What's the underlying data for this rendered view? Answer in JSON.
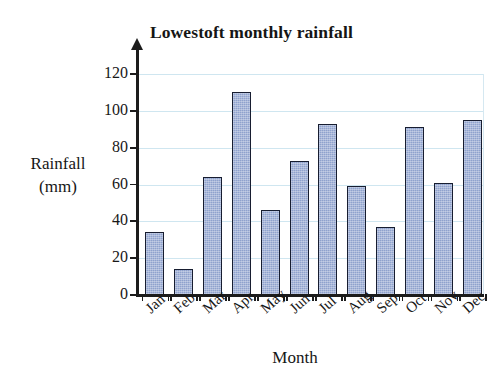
{
  "chart_data": {
    "type": "bar",
    "title": "Lowestoft monthly rainfall",
    "xlabel": "Month",
    "ylabel": "Rainfall (mm)",
    "ylabel_lines": [
      "Rainfall",
      "(mm)"
    ],
    "categories": [
      "Jan",
      "Feb",
      "Mar",
      "Apr",
      "May",
      "Jun",
      "Jul",
      "Aug",
      "Sep",
      "Oct",
      "Nov",
      "Dec"
    ],
    "values": [
      34,
      14,
      64,
      110,
      46,
      73,
      93,
      59,
      37,
      91,
      61,
      95
    ],
    "ylim": [
      0,
      120
    ],
    "ytick_labels": [
      "0",
      "20",
      "40",
      "60",
      "80",
      "100",
      "120"
    ],
    "ytick_values": [
      0,
      20,
      40,
      60,
      80,
      100,
      120
    ],
    "grid": true,
    "grid_axis": "y",
    "legend": "none",
    "bar_fill_color": "#8fa2cd",
    "bar_edge_color": "#171d30",
    "gridline_color": "#cfe6f0",
    "axis_color": "#1c1c1c",
    "x_tick_label_rotation": -42
  }
}
